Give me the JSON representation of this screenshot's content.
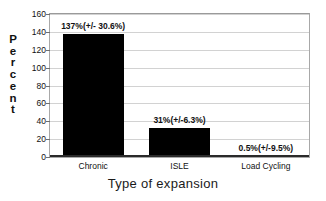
{
  "chart_data": {
    "type": "bar",
    "title": "",
    "xlabel": "Type of expansion",
    "ylabel": "Percent",
    "categories": [
      "Chronic",
      "ISLE",
      "Load Cycling"
    ],
    "values": [
      137,
      31,
      0.5
    ],
    "errors": [
      30.6,
      6.3,
      9.5
    ],
    "data_labels": [
      "137%(+/- 30.6%)",
      "31%(+/-6.3%)",
      "0.5%(+/-9.5%)"
    ],
    "ylim": [
      0,
      160
    ],
    "yticks": [
      0,
      20,
      40,
      60,
      80,
      100,
      120,
      140,
      160
    ],
    "ytick_labels": [
      "0",
      "20",
      "40",
      "60",
      "80",
      "100",
      "120",
      "140",
      "160"
    ],
    "grid": "horizontal",
    "legend": "none",
    "bar_color": "#000000",
    "grid_color": "#d2d2d2",
    "frame_color": "#a8a8a8",
    "axis_color": "#2a2a2a",
    "text_color": "#111111"
  },
  "axis": {
    "y_title_letters": [
      "P",
      "e",
      "r",
      "c",
      "e",
      "n",
      "t"
    ]
  }
}
